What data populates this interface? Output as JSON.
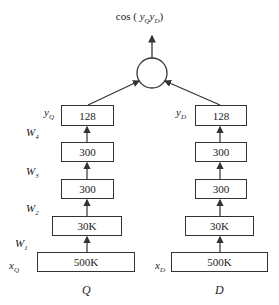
{
  "output": {
    "label_func": "cos",
    "label_open": "(",
    "label_close": ")",
    "arg1": "y",
    "arg1_sub": "Q",
    "arg2": "y",
    "arg2_sub": "D"
  },
  "columns": [
    {
      "caption": "Q",
      "input_label": "x",
      "input_sub": "Q",
      "output_label": "y",
      "output_sub": "Q",
      "layers": [
        "500K",
        "30K",
        "300",
        "300",
        "128"
      ],
      "weights": [
        {
          "w": "W",
          "sub": "1"
        },
        {
          "w": "W",
          "sub": "2"
        },
        {
          "w": "W",
          "sub": "3"
        },
        {
          "w": "W",
          "sub": "4"
        }
      ]
    },
    {
      "caption": "D",
      "input_label": "x",
      "input_sub": "D",
      "output_label": "y",
      "output_sub": "D",
      "layers": [
        "500K",
        "30K",
        "300",
        "300",
        "128"
      ]
    }
  ]
}
